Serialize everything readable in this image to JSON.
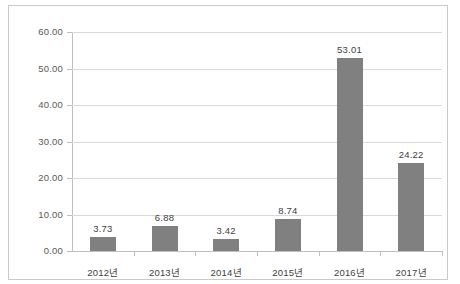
{
  "chart_data": {
    "type": "bar",
    "title": "",
    "subtitle": "",
    "xlabel": "",
    "ylabel": "",
    "categories": [
      "2012년",
      "2013년",
      "2014년",
      "2015년",
      "2016년",
      "2017년"
    ],
    "values": [
      3.73,
      6.88,
      3.42,
      8.74,
      53.01,
      24.22
    ],
    "value_labels": [
      "3.73",
      "6.88",
      "3.42",
      "8.74",
      "53.01",
      "24.22"
    ],
    "series": [
      {
        "name": "",
        "values": [
          3.73,
          6.88,
          3.42,
          8.74,
          53.01,
          24.22
        ]
      }
    ],
    "ylim": [
      0,
      60
    ],
    "ytick_step": 10,
    "ytick_labels": [
      "60.00",
      "50.00",
      "40.00",
      "30.00",
      "20.00",
      "10.00",
      "0.00"
    ],
    "ytick_values": [
      60,
      50,
      40,
      30,
      20,
      10,
      0
    ],
    "grid": true,
    "grid_axis": "y",
    "legend": false,
    "legend_position": "none",
    "bar_color": "#808080",
    "gridline_color": "#d9d9d9",
    "axis_color": "#bfbfbf",
    "frame_color": "#c9c9c9",
    "data_label_color": "#404040",
    "tick_label_color": "#595959",
    "background_color": "#ffffff",
    "data_labels_shown": true
  }
}
